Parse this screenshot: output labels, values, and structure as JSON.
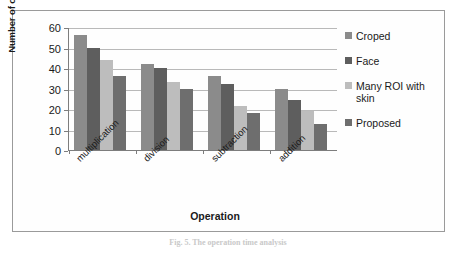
{
  "figure": {
    "caption": "Fig. 5.  The operation time analysis"
  },
  "chart_data": {
    "type": "bar",
    "title": "",
    "xlabel": "Operation",
    "ylabel": "Number of operation per iteration",
    "categories": [
      "multiplication",
      "division",
      "subtraction",
      "addition"
    ],
    "series": [
      {
        "name": "Croped",
        "color": "#8b8b8b",
        "values": [
          56,
          42,
          36,
          30
        ]
      },
      {
        "name": "Face",
        "color": "#5e5e5e",
        "values": [
          50,
          40,
          32,
          24.5
        ]
      },
      {
        "name": "Many ROI with skin",
        "color": "#bdbdbd",
        "values": [
          44,
          33,
          21.5,
          19
        ]
      },
      {
        "name": "Proposed",
        "color": "#6e6e6e",
        "values": [
          36,
          30,
          18,
          12.5
        ]
      }
    ],
    "ylim": [
      0,
      60
    ],
    "yticks": [
      0,
      10,
      20,
      30,
      40,
      50,
      60
    ],
    "ytick_labels": [
      "0",
      "10",
      "20",
      "30",
      "40",
      "50",
      "60"
    ],
    "grid": true,
    "legend_position": "right"
  },
  "colors": {
    "frame": "#9a9a9a",
    "axis": "#7d7d7d",
    "gridline": "#b9b9b9",
    "text": "#1a1a1a"
  }
}
